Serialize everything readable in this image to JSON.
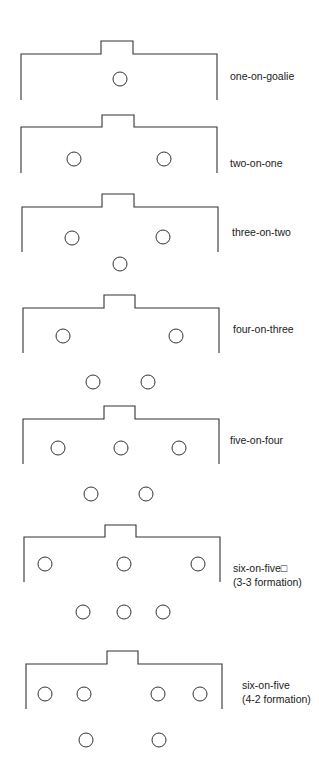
{
  "style": {
    "stroke": "#333333",
    "background": "#ffffff",
    "text": "#1a1a1a"
  },
  "diagrams": [
    {
      "label": "one-on-goalie",
      "label2": "",
      "top": 54,
      "bottom": 100,
      "left": 21,
      "right": 217,
      "goal_left": 101,
      "goal_right": 133,
      "goal_top": 41,
      "label_x": 230,
      "label_y": 69,
      "players": [
        [
          120,
          79
        ]
      ]
    },
    {
      "label": "two-on-one",
      "label2": "",
      "top": 127,
      "bottom": 173,
      "left": 21,
      "right": 217,
      "goal_left": 102,
      "goal_right": 134,
      "goal_top": 115,
      "label_x": 230,
      "label_y": 156,
      "players": [
        [
          74,
          159
        ],
        [
          164,
          159
        ]
      ]
    },
    {
      "label": "three-on-two",
      "label2": "",
      "top": 207,
      "bottom": 252,
      "left": 22,
      "right": 218,
      "goal_left": 102,
      "goal_right": 134,
      "goal_top": 194,
      "label_x": 232,
      "label_y": 225,
      "players": [
        [
          72,
          238
        ],
        [
          163,
          237
        ],
        [
          120,
          264
        ]
      ]
    },
    {
      "label": "four-on-three",
      "label2": "",
      "top": 308,
      "bottom": 353,
      "left": 23,
      "right": 219,
      "goal_left": 104,
      "goal_right": 135,
      "goal_top": 295,
      "label_x": 233,
      "label_y": 322,
      "players": [
        [
          63,
          336
        ],
        [
          176,
          336
        ],
        [
          93,
          382
        ],
        [
          148,
          382
        ]
      ]
    },
    {
      "label": "five-on-four",
      "label2": "",
      "top": 419,
      "bottom": 464,
      "left": 23,
      "right": 219,
      "goal_left": 104,
      "goal_right": 135,
      "goal_top": 406,
      "label_x": 230,
      "label_y": 433,
      "players": [
        [
          58,
          448
        ],
        [
          121,
          448
        ],
        [
          179,
          448
        ],
        [
          91,
          494
        ],
        [
          146,
          494
        ]
      ]
    },
    {
      "label": "six-on-five□",
      "label2": "(3-3 formation)",
      "top": 537,
      "bottom": 582,
      "left": 24,
      "right": 220,
      "goal_left": 105,
      "goal_right": 136,
      "goal_top": 525,
      "label_x": 233,
      "label_y": 561,
      "players": [
        [
          45,
          564
        ],
        [
          124,
          564
        ],
        [
          198,
          564
        ],
        [
          83,
          612
        ],
        [
          124,
          612
        ],
        [
          163,
          612
        ]
      ]
    },
    {
      "label": "six-on-five",
      "label2": "(4-2 formation)",
      "top": 664,
      "bottom": 709,
      "left": 26,
      "right": 222,
      "goal_left": 107,
      "goal_right": 138,
      "goal_top": 651,
      "label_x": 242,
      "label_y": 678,
      "players": [
        [
          45,
          694
        ],
        [
          84,
          694
        ],
        [
          158,
          694
        ],
        [
          200,
          694
        ],
        [
          86,
          740
        ],
        [
          159,
          740
        ]
      ]
    }
  ],
  "player_radius": 7
}
